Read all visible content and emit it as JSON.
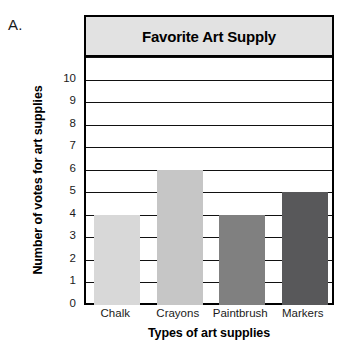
{
  "figure": {
    "letter": "A."
  },
  "chart_data": {
    "type": "bar",
    "title": "Favorite Art Supply",
    "xlabel": "Types of art supplies",
    "ylabel": "Number of votes for art supplies",
    "categories": [
      "Chalk",
      "Crayons",
      "Paintbrush",
      "Markers"
    ],
    "values": [
      4,
      6,
      4,
      5
    ],
    "bar_colors": [
      "#d8d8d8",
      "#c6c6c6",
      "#808080",
      "#58585a"
    ],
    "ylim": [
      0,
      11
    ],
    "ytick_labels": [
      "0",
      "1",
      "2",
      "3",
      "4",
      "5",
      "6",
      "7",
      "8",
      "9",
      "10"
    ],
    "ytick_values": [
      0,
      1,
      2,
      3,
      4,
      5,
      6,
      7,
      8,
      9,
      10
    ],
    "gridline_values": [
      1,
      2,
      3,
      4,
      5,
      6,
      7,
      8,
      9,
      10,
      11
    ],
    "grid": true,
    "legend": "none",
    "title_band_color": "#e2e2e2",
    "axis_color": "#000000"
  }
}
